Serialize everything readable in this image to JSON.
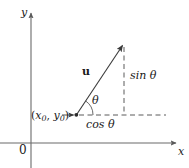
{
  "figure": {
    "kind": "unit-vector-trigonometry-diagram",
    "width": 189,
    "height": 168,
    "background_color": "#ffffff",
    "stroke_color": "#5a5a5a",
    "text_color": "#1a1a1a"
  },
  "axes": {
    "y_label": "y",
    "x_label": "x",
    "origin_label": "0",
    "x_axis_y_px": 143,
    "y_axis_x_px": 31,
    "x_axis_arrow_tip_px": 178,
    "y_axis_arrow_tip_px": 11
  },
  "labels": {
    "vector": "u",
    "angle": "θ",
    "vertical_leg": "sin θ",
    "horizontal_leg": "cos θ",
    "base_point_open": "(",
    "base_point_x": "x",
    "base_point_x_sub": "0",
    "base_point_comma": ", ",
    "base_point_y": "y",
    "base_point_y_sub": "0",
    "base_point_close": ")"
  },
  "geometry": {
    "base_point_px": [
      76,
      115
    ],
    "vector_tip_px": [
      124,
      43
    ],
    "vector_label_px": [
      85,
      73
    ],
    "sin_leg_dashed_from_px": [
      124,
      46
    ],
    "sin_leg_dashed_to_px": [
      124,
      115
    ],
    "cos_leg_dashed_from_px": [
      78,
      115
    ],
    "cos_leg_dashed_to_px": [
      166,
      115
    ],
    "angle_arc_radius_px": 17,
    "angle_degrees": 56
  }
}
